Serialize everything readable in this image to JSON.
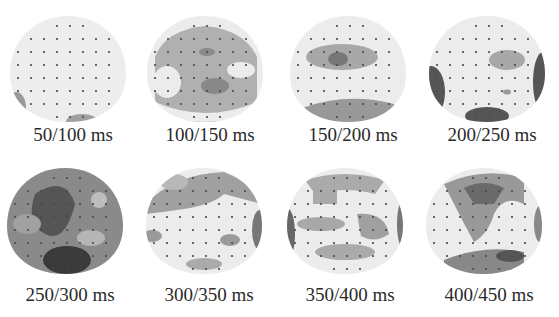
{
  "figure": {
    "colors": {
      "background": "#ffffff",
      "light": "#ececec",
      "mid": "#a8a8a8",
      "dark": "#6a6a6a",
      "darkest": "#3a3a3a",
      "electrode": "#4a4a4a"
    },
    "panels": [
      {
        "label": "50/100 ms",
        "row": 0,
        "col": 0
      },
      {
        "label": "100/150 ms",
        "row": 0,
        "col": 1
      },
      {
        "label": "150/200 ms",
        "row": 0,
        "col": 2
      },
      {
        "label": "200/250 ms",
        "row": 0,
        "col": 3
      },
      {
        "label": "250/300 ms",
        "row": 1,
        "col": 0
      },
      {
        "label": "300/350 ms",
        "row": 1,
        "col": 1
      },
      {
        "label": "350/400 ms",
        "row": 1,
        "col": 2
      },
      {
        "label": "400/450 ms",
        "row": 1,
        "col": 3
      }
    ]
  }
}
